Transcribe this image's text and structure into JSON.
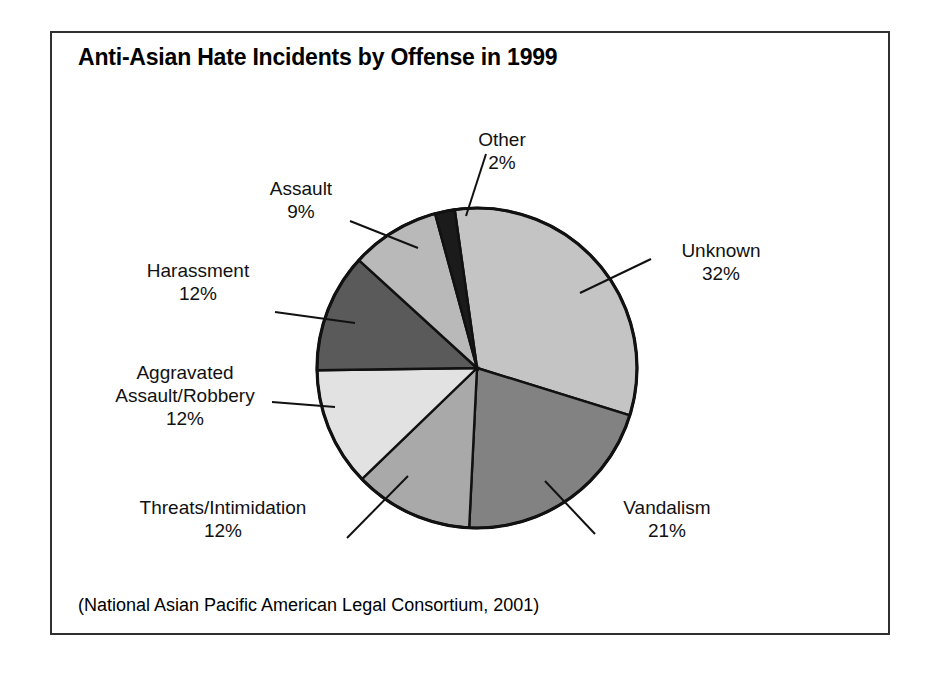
{
  "figure": {
    "title": "Anti-Asian Hate Incidents by Offense in 1999",
    "source_note": "(National Asian Pacific American Legal Consortium, 2001)"
  },
  "chart_data": {
    "type": "pie",
    "title": "Anti-Asian Hate Incidents by Offense in 1999",
    "subtitle": "",
    "xlabel": "",
    "ylabel": "",
    "legend": "none",
    "grid": false,
    "units": "percent",
    "source": "(National Asian Pacific American Legal Consortium, 2001)",
    "start_angle_deg": -8,
    "direction": "clockwise",
    "categories": [
      "Unknown",
      "Vandalism",
      "Threats/Intimidation",
      "Aggravated Assault/Robbery",
      "Harassment",
      "Assault",
      "Other"
    ],
    "values": [
      32,
      21,
      12,
      12,
      12,
      9,
      2
    ],
    "colors": [
      "#c4c4c4",
      "#828282",
      "#a9a9a9",
      "#e2e2e2",
      "#5a5a5a",
      "#b9b9b9",
      "#1b1b1b"
    ],
    "slices": [
      {
        "label": "Unknown",
        "value": 32,
        "value_text": "32%",
        "color": "#c4c4c4"
      },
      {
        "label": "Vandalism",
        "value": 21,
        "value_text": "21%",
        "color": "#828282"
      },
      {
        "label": "Threats/Intimidation",
        "value": 12,
        "value_text": "12%",
        "color": "#a9a9a9"
      },
      {
        "label": "Aggravated Assault/Robbery",
        "value": 12,
        "value_text": "12%",
        "color": "#e2e2e2"
      },
      {
        "label": "Harassment",
        "value": 12,
        "value_text": "12%",
        "color": "#5a5a5a"
      },
      {
        "label": "Assault",
        "value": 9,
        "value_text": "9%",
        "color": "#b9b9b9"
      },
      {
        "label": "Other",
        "value": 2,
        "value_text": "2%",
        "color": "#1b1b1b"
      }
    ]
  },
  "labels": {
    "other": {
      "name": "Other",
      "pct": "2%"
    },
    "assault": {
      "name": "Assault",
      "pct": "9%"
    },
    "harassment": {
      "name": "Harassment",
      "pct": "12%"
    },
    "aggravated": {
      "name_line1": "Aggravated",
      "name_line2": "Assault/Robbery",
      "pct": "12%"
    },
    "threats": {
      "name": "Threats/Intimidation",
      "pct": "12%"
    },
    "vandalism": {
      "name": "Vandalism",
      "pct": "21%"
    },
    "unknown": {
      "name": "Unknown",
      "pct": "32%"
    }
  }
}
